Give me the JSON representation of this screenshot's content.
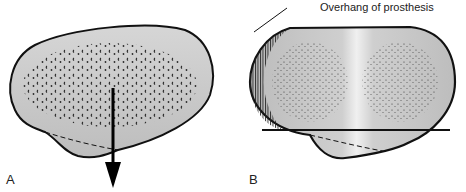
{
  "figure": {
    "panels": [
      {
        "id": "A",
        "label": "A",
        "description": "Tibial plateau cut surface with cancellous bone; arrow indicating posterior direction"
      },
      {
        "id": "B",
        "label": "B",
        "description": "Tibial prosthesis component overlying plateau with medial and lateral condyle stippling"
      }
    ],
    "annotations": [
      {
        "panel": "B",
        "text": "Overhang of prosthesis"
      }
    ],
    "colors": {
      "outline": "#111111",
      "bone_fill": "#c9c9c9",
      "prosthesis_fill": "#d4d4d4",
      "highlight": "#eeeeee",
      "background": "#ffffff"
    }
  }
}
